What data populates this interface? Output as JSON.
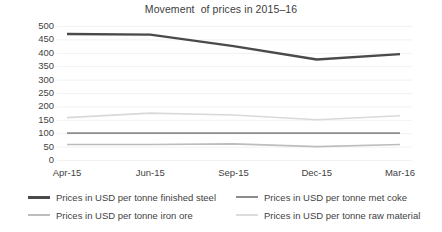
{
  "chart_data": {
    "type": "line",
    "title": "Movement  of prices in 2015–16",
    "xlabel": "",
    "ylabel": "",
    "categories": [
      "Apr-15",
      "Jun-15",
      "Sep-15",
      "Dec-15",
      "Mar-16"
    ],
    "yticks": [
      "0",
      "50",
      "100",
      "150",
      "200",
      "250",
      "300",
      "350",
      "400",
      "450",
      "500"
    ],
    "ylim": [
      0,
      500
    ],
    "grid": true,
    "legend_position": "bottom",
    "series": [
      {
        "name": "Prices in USD per tonne finished steel",
        "color": "#4a4a4a",
        "width": 2.4,
        "values": [
          470,
          468,
          425,
          375,
          395
        ]
      },
      {
        "name": "Prices in USD per tonne met coke",
        "color": "#8c8c8c",
        "width": 1.8,
        "values": [
          100,
          100,
          100,
          100,
          100
        ]
      },
      {
        "name": "Prices in USD per tonne iron ore",
        "color": "#bdbdbd",
        "width": 1.6,
        "values": [
          58,
          58,
          60,
          50,
          58
        ]
      },
      {
        "name": "Prices in USD per tonne raw material",
        "color": "#d9d9d9",
        "width": 1.6,
        "values": [
          158,
          175,
          168,
          150,
          165
        ]
      }
    ]
  },
  "legend": {
    "items": [
      {
        "label": "Prices in USD per tonne finished steel",
        "color": "#4a4a4a",
        "thickness": "3px"
      },
      {
        "label": "Prices in USD per tonne met coke",
        "color": "#8c8c8c",
        "thickness": "2px"
      },
      {
        "label": "Prices in USD per tonne iron ore",
        "color": "#bdbdbd",
        "thickness": "2px"
      },
      {
        "label": "Prices in USD per tonne raw material",
        "color": "#dcdcdc",
        "thickness": "2px"
      }
    ]
  },
  "axes": {
    "grid_color": "#f2f2f2",
    "tick_color": "#3f3f3f"
  }
}
